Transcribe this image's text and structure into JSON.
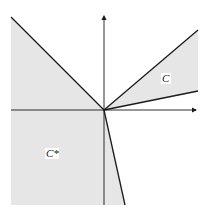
{
  "diagram": {
    "labels": {
      "cone": "C",
      "dual_cone": "C*"
    },
    "colors": {
      "shade": "#e6e6e6",
      "line": "#1a1a1a",
      "label_bg": "#ffffff"
    }
  }
}
